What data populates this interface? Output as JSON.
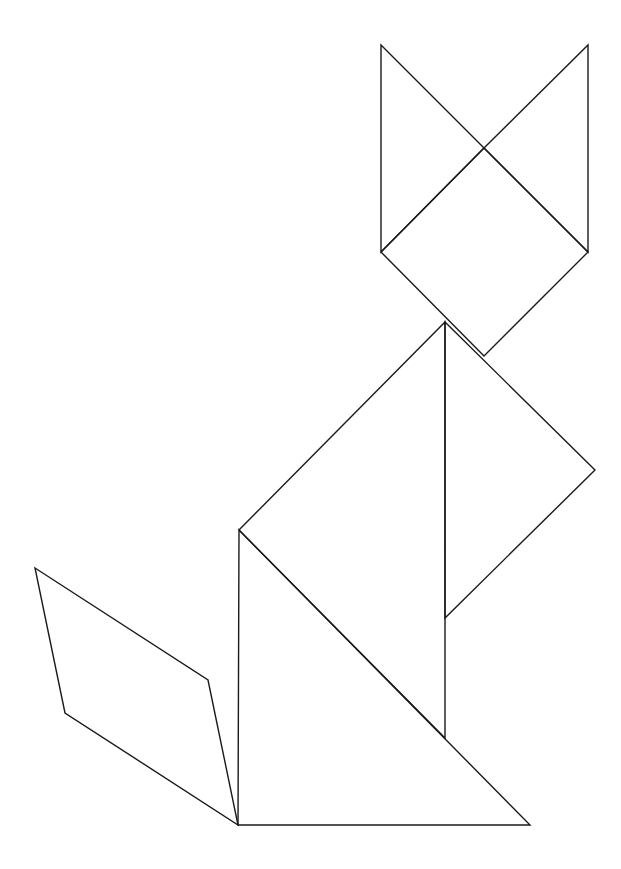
{
  "figure": {
    "width": 621,
    "height": 869,
    "background": "#ffffff",
    "stroke_color": "#1a1a1a",
    "stroke_width": 1.4,
    "pieces": [
      {
        "id": "left-ear",
        "name": "left-ear-triangle",
        "points": [
          [
            381,
            45
          ],
          [
            484,
            148
          ],
          [
            381,
            252
          ]
        ]
      },
      {
        "id": "right-ear",
        "name": "right-ear-triangle",
        "points": [
          [
            588,
            45
          ],
          [
            588,
            252
          ],
          [
            484,
            148
          ]
        ]
      },
      {
        "id": "head",
        "name": "head-square",
        "points": [
          [
            484,
            148
          ],
          [
            588,
            252
          ],
          [
            484,
            356
          ],
          [
            381,
            252
          ]
        ]
      },
      {
        "id": "chest",
        "name": "chest-triangle",
        "points": [
          [
            445,
            322
          ],
          [
            595,
            470
          ],
          [
            445,
            618
          ]
        ]
      },
      {
        "id": "body-upper",
        "name": "body-large-triangle",
        "points": [
          [
            445,
            322
          ],
          [
            445,
            738
          ],
          [
            239,
            530
          ]
        ]
      },
      {
        "id": "body-lower",
        "name": "body-base-triangle",
        "points": [
          [
            239,
            530
          ],
          [
            530,
            825
          ],
          [
            238,
            825
          ]
        ]
      },
      {
        "id": "tail",
        "name": "tail-parallelogram",
        "points": [
          [
            35,
            568
          ],
          [
            208,
            680
          ],
          [
            238,
            825
          ],
          [
            65,
            713
          ]
        ]
      }
    ]
  }
}
